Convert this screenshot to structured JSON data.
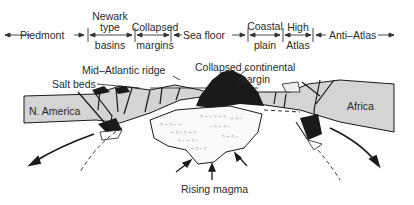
{
  "header_regions": [
    {
      "id": "piedmont",
      "lines": [
        "Piedmont"
      ]
    },
    {
      "id": "newark",
      "top": [
        "Newark",
        "type"
      ],
      "bottom": "basins"
    },
    {
      "id": "collapsed",
      "top": [
        "Collapsed"
      ],
      "bottom": "margins"
    },
    {
      "id": "seafloor",
      "lines": [
        "Sea floor"
      ]
    },
    {
      "id": "coastal",
      "top": [
        "Coastal"
      ],
      "bottom": "plain"
    },
    {
      "id": "high",
      "top": [
        "High"
      ],
      "bottom": "Atlas"
    },
    {
      "id": "antiatlas",
      "lines": [
        "Anti–Atlas"
      ]
    }
  ],
  "labels": {
    "mid_atlantic_ridge": "Mid–Atlantic ridge",
    "collapsed_continental": "Collapsed continental",
    "margin": "margin",
    "salt_beds": "Salt beds",
    "north_america": "N. America",
    "africa": "Africa",
    "rising_magma": "Rising magma"
  },
  "colors": {
    "continent": "#d4d4d4",
    "ink": "#1a1a1a",
    "magma": "#ffffff"
  }
}
